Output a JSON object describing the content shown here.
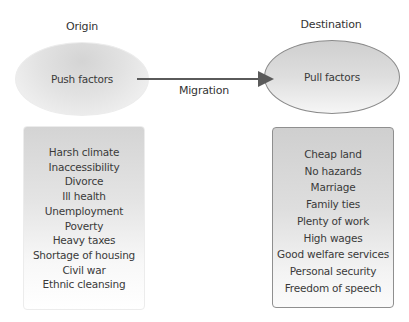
{
  "diagram": {
    "origin_label": "Origin",
    "destination_label": "Destination",
    "push_node": "Push factors",
    "pull_node": "Pull factors",
    "arrow_label": "Migration",
    "push_factors": [
      "Harsh climate",
      "Inaccessibility",
      "Divorce",
      "Ill health",
      "Unemployment",
      "Poverty",
      "Heavy taxes",
      "Shortage of housing",
      "Civil war",
      "Ethnic cleansing"
    ],
    "pull_factors": [
      "Cheap land",
      "No hazards",
      "Marriage",
      "Family ties",
      "Plenty of work",
      "High wages",
      "Good welfare services",
      "Personal security",
      "Freedom of speech"
    ],
    "colors": {
      "arrow": "#5a5a5a",
      "text": "#3a3a3a",
      "pull_border": "#8a8a8a"
    }
  }
}
